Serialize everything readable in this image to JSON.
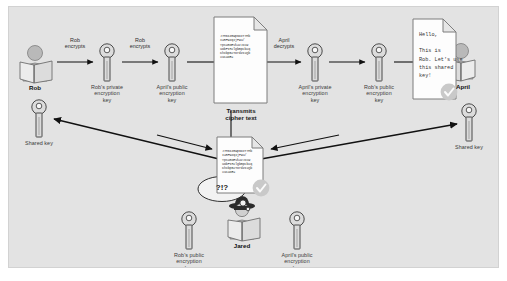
{
  "diagram": {
    "canvas_color": "#e3e3e3",
    "page_color": "#ffffff"
  },
  "actors": {
    "rob": {
      "name": "Rob",
      "icon": "person-reading-icon"
    },
    "april": {
      "name": "April",
      "icon": "person-reading-icon"
    },
    "jared": {
      "name": "Jared",
      "icon": "spy-hacker-icon",
      "thought": "?!?"
    }
  },
  "keys": {
    "rob_private": "Rob's private\nencryption\nkey",
    "april_public": "April's public\nencryption\nkey",
    "april_private": "April's private\nencryption\nkey",
    "rob_public": "Rob's public\nencryption\nkey",
    "shared_left": "Shared key",
    "shared_right": "Shared key",
    "jared_rob_public": "Rob's public\nencryption\nkey",
    "jared_april_public": "April's public\nencryption\nkey"
  },
  "arrow_labels": {
    "rob_encrypts_1": "Rob\nencrypts",
    "rob_encrypts_2": "Rob\nencrypts",
    "april_decrypts": "April\ndecrypts"
  },
  "notes": {
    "transmit_caption": "Transmits\ncipher text",
    "cipher_text": "J7M6IZ8Wp6OIT7Mb\nIaRFwzqIjPWu/\nYpsU8OEVkavJxcW\nuDbFIH2lgbmpcbXq\nKhxbpB2TOrdZIXQb\nXuCaOE=",
    "message_text": "Hello,\n\nThis is\nRob. Let's use\nthis shared\nkey!"
  },
  "status": {
    "verified_icon": "check-circle-icon"
  },
  "colors": {
    "canvas": "#e3e3e3",
    "key_fill": "#d8d8d8",
    "key_stroke": "#4a4a4a",
    "person_fill": "#c9c9c9",
    "arrow": "#111111",
    "note_bg": "#fdfdfd",
    "check_badge": "#c4c4c4"
  }
}
